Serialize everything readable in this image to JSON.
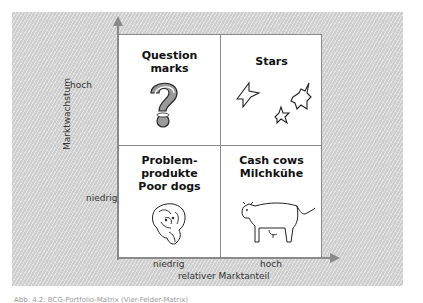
{
  "diagram": {
    "title": "BCG-Portfolio-Matrix",
    "y_axis": {
      "label": "Marktwachstum",
      "ticks": [
        "hoch",
        "niedrig"
      ]
    },
    "x_axis": {
      "label": "relativer Marktanteil",
      "ticks": [
        "niedrig",
        "hoch"
      ]
    },
    "quadrants": [
      {
        "position": "top-left",
        "title": "Question\nmarks",
        "icon": "question-mark-icon"
      },
      {
        "position": "top-right",
        "title": "Stars",
        "icon": "stars-icon"
      },
      {
        "position": "bottom-left",
        "title": "Problem-\nprodukte\nPoor dogs",
        "icon": "dog-icon"
      },
      {
        "position": "bottom-right",
        "title": "Cash cows\nMilchkühe",
        "icon": "cow-icon"
      }
    ],
    "colors": {
      "background_panel": "#d6d6d6",
      "axis": "#8a8a8a",
      "quadrant_fill": "#ffffff",
      "question_mark_fill": "#9a9a9a"
    }
  },
  "caption": "Abb. 4.2: BCG-Portfolio-Matrix (Vier-Felder-Matrix)"
}
